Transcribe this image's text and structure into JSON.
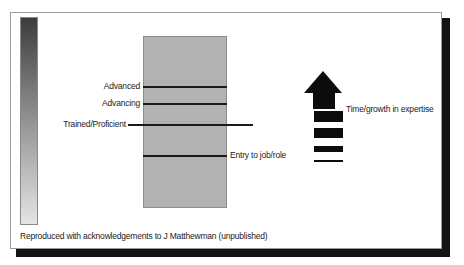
{
  "diagram": {
    "levels": [
      {
        "label": "Advanced",
        "position": "left"
      },
      {
        "label": "Advancing",
        "position": "left"
      },
      {
        "label": "Trained/Proficient",
        "position": "left"
      },
      {
        "label": "Entry to job/role",
        "position": "right"
      }
    ],
    "arrow_label": "Time/growth in expertise",
    "caption": "Reproduced with acknowledgements to J Matthewman (unpublished)",
    "colors": {
      "gradient_top": "#3c3c3c",
      "gradient_bottom": "#e4e4e4",
      "box_fill": "#b2b2b2",
      "lines": "#1a1a1a",
      "arrow": "#0c0c0c",
      "shadow": "#141414"
    }
  }
}
